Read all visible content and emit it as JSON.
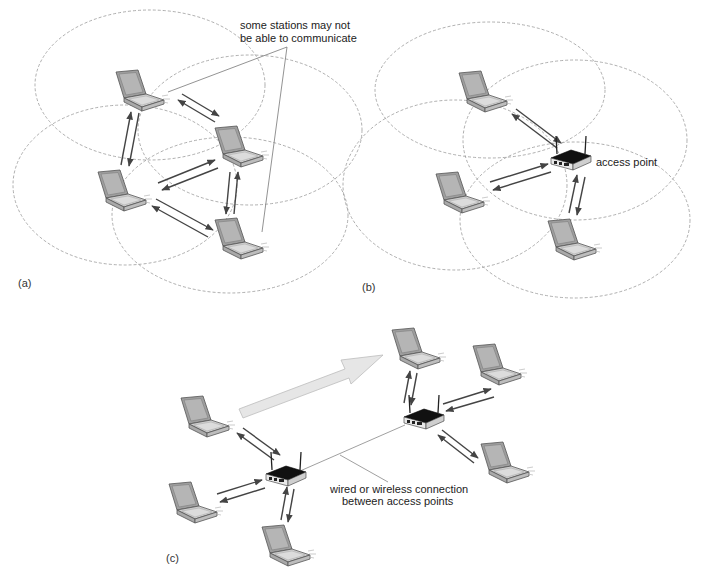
{
  "figure": {
    "panels": [
      {
        "id": "a",
        "label": "(a)",
        "annotation": "some stations may not\nbe able to communicate",
        "annotation_lines": [
          "some stations may not",
          "be able to communicate"
        ],
        "description": "ad hoc network: four laptops communicating directly with each other",
        "nodes": [
          {
            "type": "laptop",
            "name": "station-1"
          },
          {
            "type": "laptop",
            "name": "station-2"
          },
          {
            "type": "laptop",
            "name": "station-3"
          },
          {
            "type": "laptop",
            "name": "station-4"
          }
        ],
        "links": [
          [
            "station-1",
            "station-2"
          ],
          [
            "station-1",
            "station-3"
          ],
          [
            "station-3",
            "station-2"
          ],
          [
            "station-3",
            "station-4"
          ],
          [
            "station-2",
            "station-4"
          ]
        ]
      },
      {
        "id": "b",
        "label": "(b)",
        "annotation": "access point",
        "description": "infrastructure network: three laptops communicating via an access point",
        "nodes": [
          {
            "type": "laptop",
            "name": "station-1"
          },
          {
            "type": "laptop",
            "name": "station-2"
          },
          {
            "type": "laptop",
            "name": "station-3"
          },
          {
            "type": "access-point",
            "name": "access-point"
          }
        ]
      },
      {
        "id": "c",
        "label": "(c)",
        "annotation_lines": [
          "wired or wireless connection",
          "between access points"
        ],
        "description": "two access points connected, each serving three laptops; large arrow indicates a station roaming from one AP to the other",
        "nodes": [
          {
            "type": "laptop",
            "name": "station-1"
          },
          {
            "type": "laptop",
            "name": "station-2"
          },
          {
            "type": "laptop",
            "name": "station-3"
          },
          {
            "type": "laptop",
            "name": "station-4"
          },
          {
            "type": "laptop",
            "name": "station-5"
          },
          {
            "type": "laptop",
            "name": "station-6"
          },
          {
            "type": "access-point",
            "name": "access-point-1"
          },
          {
            "type": "access-point",
            "name": "access-point-2"
          }
        ]
      }
    ],
    "colors": {
      "laptop_body": "#b9b9b9",
      "laptop_screen": "#a8a8a8",
      "laptop_outline": "#555555",
      "access_point": "#111111",
      "range_circle": "#9a9a9a",
      "roam_arrow": "#e6e6e6"
    }
  }
}
